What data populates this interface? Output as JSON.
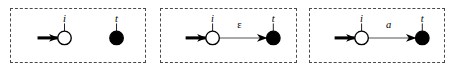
{
  "figure": {
    "type": "automaton-construction-diagram",
    "panel_count": 3,
    "colors": {
      "stroke": "#000000",
      "initial_state_fill": "#ffffff",
      "final_state_fill": "#000000",
      "panel_border": "#4a4a4a",
      "edge_line": "#555555",
      "background": "#ffffff"
    },
    "panels": [
      {
        "id": "panel-1",
        "name": "empty-language-fragment",
        "nodes": [
          {
            "id": "n1-i",
            "label": "i",
            "kind": "initial-open-circle",
            "cx": 54,
            "cy": 30,
            "r": 7
          },
          {
            "id": "n1-t",
            "label": "t",
            "kind": "final-filled-circle",
            "cx": 108,
            "cy": 30,
            "r": 7
          }
        ],
        "start_arrow": {
          "from_x": 26,
          "to_x": 47,
          "y": 30
        },
        "edges": []
      },
      {
        "id": "panel-2",
        "name": "epsilon-transition-fragment",
        "nodes": [
          {
            "id": "n2-i",
            "label": "i",
            "kind": "initial-open-circle",
            "cx": 52,
            "cy": 30,
            "r": 7
          },
          {
            "id": "n2-t",
            "label": "t",
            "kind": "final-filled-circle",
            "cx": 115,
            "cy": 30,
            "r": 7
          }
        ],
        "start_arrow": {
          "from_x": 24,
          "to_x": 45,
          "y": 30
        },
        "edges": [
          {
            "id": "e2",
            "from": "n2-i",
            "to": "n2-t",
            "label": "ε",
            "label_style": "upright",
            "label_x": 80,
            "label_y": 18
          }
        ]
      },
      {
        "id": "panel-3",
        "name": "symbol-transition-fragment",
        "nodes": [
          {
            "id": "n3-i",
            "label": "i",
            "kind": "initial-open-circle",
            "cx": 52,
            "cy": 30,
            "r": 7
          },
          {
            "id": "n3-t",
            "label": "t",
            "kind": "final-filled-circle",
            "cx": 115,
            "cy": 30,
            "r": 7
          }
        ],
        "start_arrow": {
          "from_x": 24,
          "to_x": 45,
          "y": 30
        },
        "edges": [
          {
            "id": "e3",
            "from": "n3-i",
            "to": "n3-t",
            "label": "a",
            "label_style": "italic",
            "label_x": 80,
            "label_y": 18
          }
        ]
      }
    ],
    "labels": {
      "initial_state": "i",
      "final_state": "t",
      "epsilon_symbol": "ε",
      "symbol_a": "a"
    }
  }
}
